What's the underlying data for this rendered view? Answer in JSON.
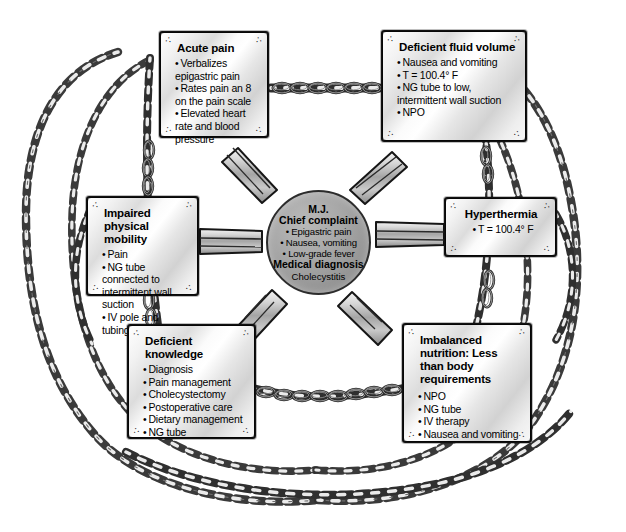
{
  "diagram": {
    "center": {
      "patient_initials": "M.J.",
      "chief_complaint_label": "Chief complaint",
      "chief_complaint_items": [
        "Epigastric pain",
        "Nausea, vomiting",
        "Low-grade fever"
      ],
      "medical_diagnosis_label": "Medical diagnosis",
      "medical_diagnosis": "Cholecystitis"
    },
    "nodes": [
      {
        "id": "acute-pain",
        "title": "Acute pain",
        "items": [
          "Verbalizes epigastric pain",
          "Rates pain an 8 on the pain scale",
          "Elevated heart rate and blood pressure"
        ]
      },
      {
        "id": "fluid-volume",
        "title": "Deficient fluid volume",
        "items": [
          "Nausea and vomiting",
          "T = 100.4° F",
          "NG tube to low, intermittent wall suction",
          "NPO"
        ]
      },
      {
        "id": "mobility",
        "title": "Impaired physical mobility",
        "items": [
          "Pain",
          "NG tube connected to intermittent wall suction",
          "IV pole and tubing"
        ]
      },
      {
        "id": "hyperthermia",
        "title": "Hyperthermia",
        "items": [
          "T = 100.4° F"
        ]
      },
      {
        "id": "knowledge",
        "title": "Deficient knowledge",
        "items": [
          "Diagnosis",
          "Pain management",
          "Cholecystectomy",
          "Postoperative care",
          "Dietary management",
          "NG tube"
        ]
      },
      {
        "id": "nutrition",
        "title": "Imbalanced nutrition: Less than body requirements",
        "items": [
          "NPO",
          "NG tube",
          "IV therapy",
          "Nausea and vomiting"
        ]
      }
    ],
    "bullet_glyph": "•",
    "corner_curl_glyph": "∴",
    "colors": {
      "background": "#ffffff",
      "box_border": "#111111",
      "box_fill_light": "#ffffff",
      "box_fill_shade": "#d2d2d2",
      "center_fill": "#9a9a9a",
      "center_border": "#2c2c2c",
      "spoke_fill": "#9e9e9e",
      "spoke_outline": "#1a1a1a",
      "chain_stroke": "#3a3a3a",
      "text": "#000000"
    }
  }
}
